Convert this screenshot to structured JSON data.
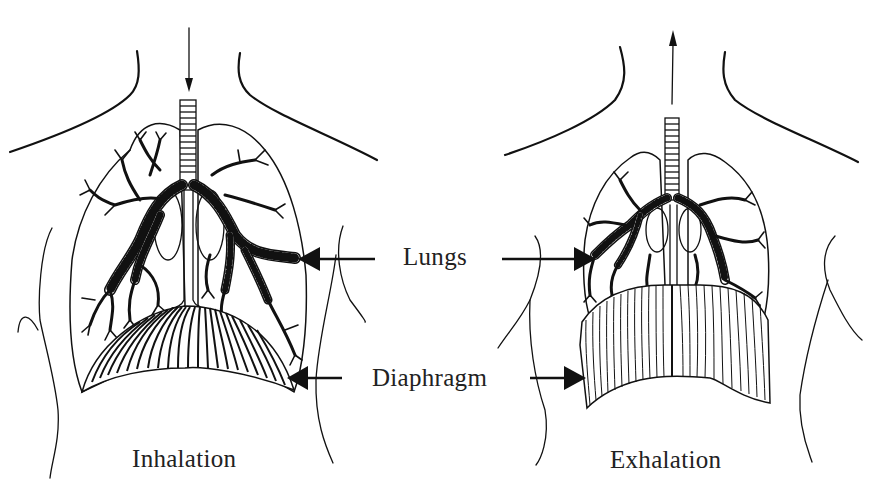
{
  "diagram": {
    "panels": [
      {
        "id": "inhalation",
        "caption": "Inhalation",
        "airflow_direction": "down",
        "diaphragm_state": "contracted/flattened",
        "lung_state": "expanded"
      },
      {
        "id": "exhalation",
        "caption": "Exhalation",
        "airflow_direction": "up",
        "diaphragm_state": "relaxed/domed",
        "lung_state": "contracted"
      }
    ],
    "labels": {
      "lungs": "Lungs",
      "diaphragm": "Diaphragm"
    },
    "colors": {
      "ink": "#111111",
      "background": "#ffffff",
      "text": "#222222"
    }
  }
}
